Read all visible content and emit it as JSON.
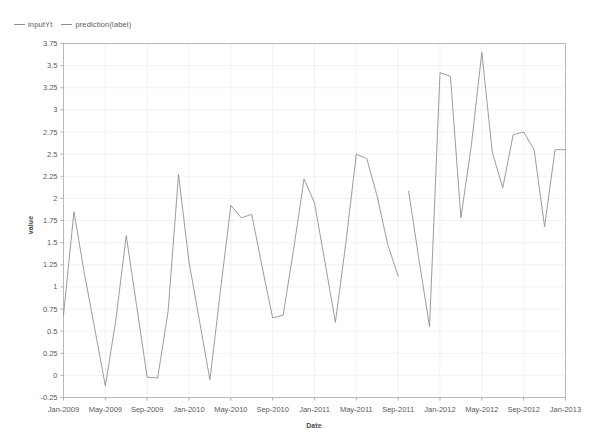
{
  "legend": {
    "position": "top-left",
    "entries": [
      {
        "label": "inputYt",
        "color": "#8a8a8a"
      },
      {
        "label": "prediction(label)",
        "color": "#8a8a8a"
      }
    ]
  },
  "chart_data": {
    "type": "line",
    "title": "",
    "xlabel": "Date",
    "ylabel": "value",
    "grid": true,
    "legend_position": "top-left",
    "ylim": [
      -0.25,
      3.75
    ],
    "ytick_labels": [
      "3.75",
      "3.5",
      "3.25",
      "3",
      "2.75",
      "2.5",
      "2.25",
      "2",
      "1.75",
      "1.5",
      "1.25",
      "1",
      "0.75",
      "0.5",
      "0.25",
      "0",
      "-0.25"
    ],
    "ytick_values": [
      3.75,
      3.5,
      3.25,
      3,
      2.75,
      2.5,
      2.25,
      2,
      1.75,
      1.5,
      1.25,
      1,
      0.75,
      0.5,
      0.25,
      0,
      -0.25
    ],
    "xtick_labels": [
      "Jan-2009",
      "May-2009",
      "Sep-2009",
      "Jan-2010",
      "May-2010",
      "Sep-2010",
      "Jan-2011",
      "May-2011",
      "Sep-2011",
      "Jan-2012",
      "May-2012",
      "Sep-2012",
      "Jan-2013"
    ],
    "xtick_indices": [
      0,
      4,
      8,
      12,
      16,
      20,
      24,
      28,
      32,
      36,
      40,
      44,
      48
    ],
    "x": [
      "Jan-2009",
      "Feb-2009",
      "Mar-2009",
      "Apr-2009",
      "May-2009",
      "Jun-2009",
      "Jul-2009",
      "Aug-2009",
      "Sep-2009",
      "Oct-2009",
      "Nov-2009",
      "Dec-2009",
      "Jan-2010",
      "Feb-2010",
      "Mar-2010",
      "Apr-2010",
      "May-2010",
      "Jun-2010",
      "Jul-2010",
      "Aug-2010",
      "Sep-2010",
      "Oct-2010",
      "Nov-2010",
      "Dec-2010",
      "Jan-2011",
      "Feb-2011",
      "Mar-2011",
      "Apr-2011",
      "May-2011",
      "Jun-2011",
      "Jul-2011",
      "Aug-2011",
      "Sep-2011",
      "Oct-2011",
      "Nov-2011",
      "Dec-2011",
      "Jan-2012",
      "Feb-2012",
      "Mar-2012",
      "Apr-2012",
      "May-2012",
      "Jun-2012",
      "Jul-2012",
      "Aug-2012",
      "Sep-2012",
      "Oct-2012",
      "Nov-2012",
      "Dec-2012",
      "Jan-2013"
    ],
    "series": [
      {
        "name": "inputYt",
        "color": "#8a8a8a",
        "start_index": 0,
        "values": [
          0.68,
          1.85,
          1.15,
          0.52,
          -0.12,
          0.62,
          1.58,
          0.78,
          -0.02,
          -0.03,
          0.72,
          2.27,
          1.28,
          0.62,
          -0.05,
          0.95,
          1.92,
          1.78,
          1.82,
          1.22,
          0.65,
          0.68,
          1.42,
          2.22,
          1.95,
          1.28,
          0.6,
          1.5,
          2.5,
          2.45,
          2.02,
          1.48,
          1.12,
          null,
          null,
          null,
          null,
          null,
          null,
          null,
          null,
          null,
          null,
          null,
          null,
          null,
          null,
          null,
          null
        ]
      },
      {
        "name": "prediction(label)",
        "color": "#8a8a8a",
        "start_index": 33,
        "values": [
          null,
          null,
          null,
          null,
          null,
          null,
          null,
          null,
          null,
          null,
          null,
          null,
          null,
          null,
          null,
          null,
          null,
          null,
          null,
          null,
          null,
          null,
          null,
          null,
          null,
          null,
          null,
          null,
          null,
          null,
          null,
          null,
          null,
          2.08,
          1.3,
          0.55,
          3.42,
          3.38,
          1.78,
          2.6,
          3.65,
          2.52,
          2.12,
          2.72,
          2.75,
          2.55,
          1.68,
          2.55,
          2.55
        ]
      }
    ]
  }
}
